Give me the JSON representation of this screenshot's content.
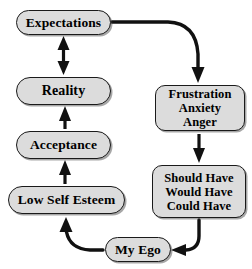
{
  "diagram": {
    "background_color": "#ffffff",
    "node_fill_color": "#dcdcdc",
    "node_border_color": "#1a1a1a",
    "arrow_color": "#111111",
    "nodes": [
      {
        "id": "expectations",
        "lines": [
          "Expectations"
        ]
      },
      {
        "id": "reality",
        "lines": [
          "Reality"
        ]
      },
      {
        "id": "acceptance",
        "lines": [
          "Acceptance"
        ]
      },
      {
        "id": "low_self_esteem",
        "lines": [
          "Low Self Esteem"
        ]
      },
      {
        "id": "frustration",
        "lines": [
          "Frustration",
          "Anxiety",
          "Anger"
        ]
      },
      {
        "id": "should_have",
        "lines": [
          "Should Have",
          "Would Have",
          "Could Have"
        ]
      },
      {
        "id": "my_ego",
        "lines": [
          "My Ego"
        ]
      }
    ],
    "labels": {
      "expectations": "Expectations",
      "reality": "Reality",
      "acceptance": "Acceptance",
      "low_self_esteem": "Low Self Esteem",
      "frustration_line1": "Frustration",
      "frustration_line2": "Anxiety",
      "frustration_line3": "Anger",
      "should_have_line1": "Should Have",
      "should_have_line2": "Would Have",
      "should_have_line3": "Could Have",
      "my_ego": "My Ego"
    },
    "edges": [
      {
        "id": "expectations-to-frustration",
        "from": "expectations",
        "to": "frustration",
        "style": "curved",
        "heads": "end"
      },
      {
        "id": "expectations-reality",
        "from": "reality",
        "to": "expectations",
        "style": "straight",
        "heads": "both"
      },
      {
        "id": "acceptance-to-reality",
        "from": "acceptance",
        "to": "reality",
        "style": "straight",
        "heads": "end"
      },
      {
        "id": "low-self-esteem-to-acceptance",
        "from": "low_self_esteem",
        "to": "acceptance",
        "style": "straight",
        "heads": "end"
      },
      {
        "id": "frustration-to-should-have",
        "from": "frustration",
        "to": "should_have",
        "style": "straight",
        "heads": "end"
      },
      {
        "id": "should-have-to-my-ego",
        "from": "should_have",
        "to": "my_ego",
        "style": "curved",
        "heads": "end"
      },
      {
        "id": "my-ego-to-low-self-esteem",
        "from": "my_ego",
        "to": "low_self_esteem",
        "style": "curved",
        "heads": "end"
      }
    ]
  }
}
